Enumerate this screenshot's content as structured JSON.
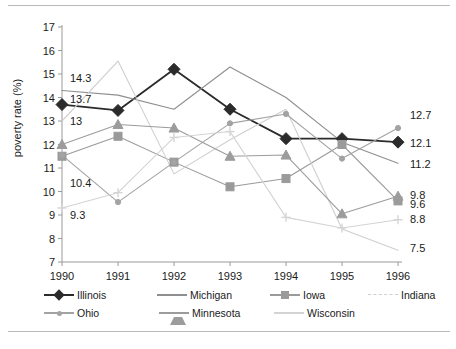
{
  "chart_data": {
    "type": "line",
    "title": "",
    "xlabel": "",
    "ylabel": "poverty rate (%)",
    "x": [
      "1990",
      "1991",
      "1992",
      "1993",
      "1994",
      "1995",
      "1996"
    ],
    "xlim": [
      "1990",
      "1996"
    ],
    "ylim": [
      7,
      17
    ],
    "yticks": [
      "7",
      "8",
      "9",
      "10",
      "11",
      "12",
      "13",
      "14",
      "15",
      "16",
      "17"
    ],
    "grid": false,
    "legend_position": "bottom",
    "series": [
      {
        "name": "Illinois",
        "marker": "diamond",
        "color": "#2b2b2b",
        "values": [
          13.7,
          13.45,
          15.2,
          13.5,
          12.25,
          12.25,
          12.1
        ]
      },
      {
        "name": "Michigan",
        "marker": "none",
        "color": "#8f8f8f",
        "values": [
          14.3,
          14.1,
          13.5,
          15.3,
          14.0,
          12.1,
          11.2
        ]
      },
      {
        "name": "Iowa",
        "marker": "square",
        "color": "#9a9a9a",
        "values": [
          11.5,
          12.35,
          11.25,
          10.2,
          10.55,
          12.0,
          9.6
        ]
      },
      {
        "name": "Indiana",
        "marker": "none",
        "color": "#cfcfcf",
        "values": [
          13.0,
          15.55,
          10.75,
          12.2,
          13.5,
          8.4,
          7.5
        ]
      },
      {
        "name": "Ohio",
        "marker": "circle-small",
        "color": "#a3a3a3",
        "values": [
          11.55,
          9.55,
          11.25,
          12.9,
          13.3,
          11.4,
          12.7
        ]
      },
      {
        "name": "Minnesota",
        "marker": "triangle",
        "color": "#9c9c9c",
        "values": [
          12.0,
          12.85,
          12.7,
          11.5,
          11.55,
          9.05,
          9.8
        ]
      },
      {
        "name": "Wisconsin",
        "marker": "cross",
        "color": "#d4d4d4",
        "values": [
          9.3,
          9.95,
          12.3,
          12.55,
          8.9,
          8.45,
          8.8
        ]
      }
    ],
    "annotations": [
      {
        "text": "14.3",
        "x": 1990,
        "y": 14.85,
        "align": "left"
      },
      {
        "text": "13.7",
        "x": 1990,
        "y": 13.95,
        "align": "left"
      },
      {
        "text": "13",
        "x": 1990,
        "y": 13.0,
        "align": "left"
      },
      {
        "text": "10.4",
        "x": 1990,
        "y": 10.35,
        "align": "left"
      },
      {
        "text": "9.3",
        "x": 1990,
        "y": 9.0,
        "align": "left"
      },
      {
        "text": "12.7",
        "x": 1996,
        "y": 13.25,
        "align": "right"
      },
      {
        "text": "12.1",
        "x": 1996,
        "y": 12.05,
        "align": "right"
      },
      {
        "text": "11.2",
        "x": 1996,
        "y": 11.15,
        "align": "right"
      },
      {
        "text": "9.8",
        "x": 1996,
        "y": 9.85,
        "align": "right"
      },
      {
        "text": "9.6",
        "x": 1996,
        "y": 9.45,
        "align": "right"
      },
      {
        "text": "8.8",
        "x": 1996,
        "y": 8.85,
        "align": "right"
      },
      {
        "text": "7.5",
        "x": 1996,
        "y": 7.6,
        "align": "right"
      }
    ]
  },
  "legend": {
    "rows": [
      [
        {
          "label": "Illinois",
          "marker": "diamond",
          "color": "#2b2b2b"
        },
        {
          "label": "Michigan",
          "marker": "none",
          "color": "#8f8f8f"
        },
        {
          "label": "Iowa",
          "marker": "square",
          "color": "#9a9a9a"
        },
        {
          "label": "Indiana",
          "marker": "dash",
          "color": "#cfcfcf"
        }
      ],
      [
        {
          "label": "Ohio",
          "marker": "circle-small",
          "color": "#a3a3a3"
        },
        {
          "label": "Minnesota",
          "marker": "triangle",
          "color": "#9c9c9c"
        },
        {
          "label": "Wisconsin",
          "marker": "cross",
          "color": "#d4d4d4"
        }
      ]
    ]
  }
}
